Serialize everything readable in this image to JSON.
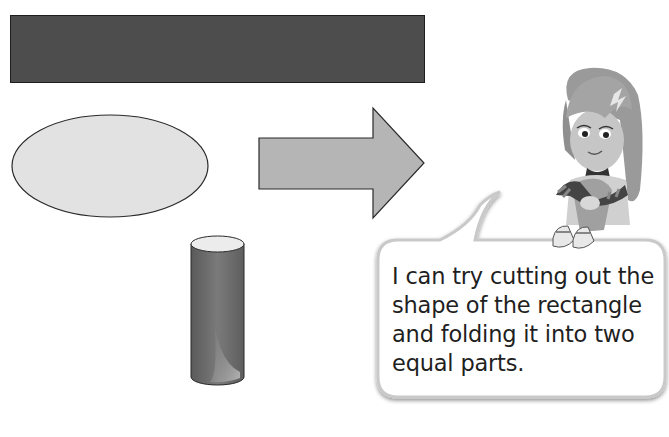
{
  "page": {
    "top_text_cutoff": ""
  },
  "shapes": [
    {
      "name": "rectangle",
      "fill": "#4d4d4d"
    },
    {
      "name": "ellipse",
      "fill": "#e2e2e2"
    },
    {
      "name": "arrow",
      "fill": "#b5b5b5"
    },
    {
      "name": "cylinder",
      "fill": "#6b6b6b"
    }
  ],
  "speech_bubble": {
    "text": "I can try cutting out the shape of the rectangle and folding it into two equal parts."
  },
  "character": {
    "name": "girl-character"
  }
}
